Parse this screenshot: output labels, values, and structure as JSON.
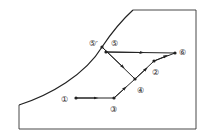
{
  "diagram": {
    "type": "state-process-diagram",
    "colors": {
      "line": "#222222",
      "frame": "#333333",
      "background": "#ffffff"
    },
    "points": [
      {
        "id": "p1",
        "label": "①"
      },
      {
        "id": "p2",
        "label": "②"
      },
      {
        "id": "p3",
        "label": "③"
      },
      {
        "id": "p4",
        "label": "④"
      },
      {
        "id": "p5",
        "label": "⑤"
      },
      {
        "id": "p5prime",
        "label": "⑤′"
      },
      {
        "id": "p6",
        "label": "⑥"
      }
    ],
    "processes": [
      {
        "from": "①",
        "to": "③"
      },
      {
        "from": "③",
        "to": "④"
      },
      {
        "from": "④",
        "to": "②"
      },
      {
        "from": "②",
        "to": "⑥"
      },
      {
        "from": "⑤",
        "to": "⑥"
      },
      {
        "from": "⑤",
        "to": "④"
      }
    ]
  }
}
